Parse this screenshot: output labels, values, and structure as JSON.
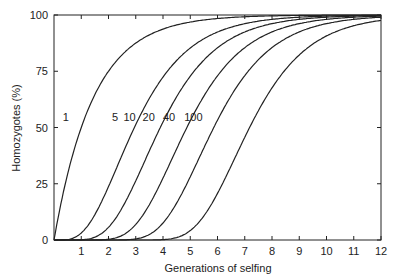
{
  "chart_data": {
    "type": "line",
    "title": "",
    "xlabel": "Generations of selfing",
    "ylabel": "Homozygotes (%)",
    "xlim": [
      0,
      12
    ],
    "ylim": [
      0,
      100
    ],
    "x_ticks": [
      1,
      2,
      3,
      4,
      5,
      6,
      7,
      8,
      9,
      10,
      11,
      12
    ],
    "y_ticks": [
      0,
      25,
      50,
      75,
      100
    ],
    "grid": false,
    "x": [
      0,
      1,
      2,
      3,
      4,
      5,
      6,
      7,
      8,
      9,
      10,
      11,
      12
    ],
    "series": [
      {
        "name": "1",
        "values": [
          0,
          50,
          75,
          87.5,
          93.8,
          96.9,
          98.4,
          99.2,
          99.6,
          99.8,
          99.9,
          100,
          100
        ],
        "label_pos": [
          0.55,
          53
        ]
      },
      {
        "name": "5",
        "values": [
          0,
          3.1,
          23.7,
          51.3,
          72.4,
          85.3,
          92.4,
          96.1,
          98.1,
          99.0,
          99.5,
          99.8,
          99.9
        ],
        "label_pos": [
          2.35,
          53
        ]
      },
      {
        "name": "10",
        "values": [
          0,
          0.1,
          5.6,
          26.3,
          52.4,
          72.8,
          85.4,
          92.4,
          96.1,
          98.1,
          99.0,
          99.5,
          99.8
        ],
        "label_pos": [
          3.0,
          53
        ]
      },
      {
        "name": "20",
        "values": [
          0,
          0,
          0.3,
          6.9,
          27.5,
          53.0,
          72.9,
          85.4,
          92.5,
          96.2,
          98.1,
          99.0,
          99.5
        ],
        "label_pos": [
          3.7,
          53
        ]
      },
      {
        "name": "40",
        "values": [
          0,
          0,
          0,
          0.5,
          7.5,
          28.1,
          53.2,
          72.9,
          85.5,
          92.5,
          96.2,
          98.1,
          99.0
        ],
        "label_pos": [
          4.45,
          53
        ]
      },
      {
        "name": "100",
        "values": [
          0,
          0,
          0,
          0,
          0.2,
          4.2,
          20.9,
          45.6,
          67.6,
          82.3,
          90.7,
          95.2,
          97.6
        ],
        "label_pos": [
          5.45,
          53
        ]
      }
    ]
  }
}
